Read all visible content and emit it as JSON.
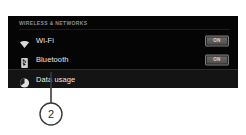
{
  "panel": {
    "section_header": "WIRELESS & NETWORKS",
    "rows": [
      {
        "label": "Wi-Fi",
        "icon": "wifi-icon",
        "toggle": "ON",
        "selected": false
      },
      {
        "label": "Bluetooth",
        "icon": "bluetooth-icon",
        "toggle": "ON",
        "selected": false
      },
      {
        "label": "Data usage",
        "icon": "data-usage-icon",
        "toggle": null,
        "selected": true
      }
    ]
  },
  "callout": {
    "number": "2"
  },
  "colors": {
    "panel_background": "#050505",
    "page_background": "#ffffff",
    "header_text": "#8f8f8f",
    "row_text": "#e8e8e8",
    "selected_row": "#141414",
    "toggle_fill": "#5c5c5c",
    "callout_stroke": "#3a3a3a"
  }
}
